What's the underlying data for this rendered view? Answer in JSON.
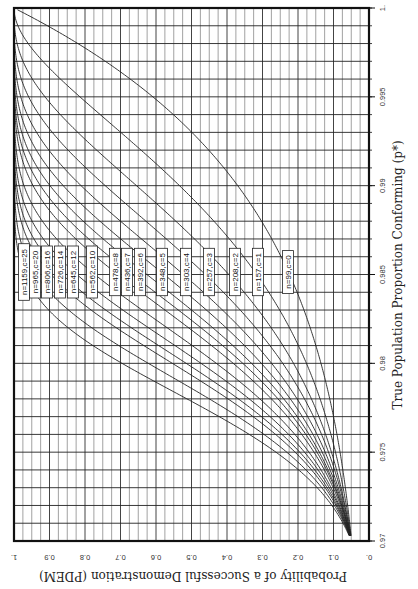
{
  "chart_data": {
    "type": "line",
    "orientation": "rotated-90-clockwise",
    "title": "",
    "xlabel": "True Population Proportion Conforming (p*)",
    "ylabel": "Probability of a Successful Demonstration (PDEM)",
    "xlim": [
      0.97,
      1.0
    ],
    "ylim": [
      0.0,
      1.0
    ],
    "x_ticks": [
      "0.97",
      "0.975",
      "0.98",
      "0.985",
      "0.99",
      "0.995",
      "1."
    ],
    "y_ticks": [
      "0.",
      "0.1",
      "0.2",
      "0.3",
      "0.4",
      "0.5",
      "0.6",
      "0.7",
      "0.8",
      "0.9",
      "1."
    ],
    "grid": {
      "x_minor_step": 0.001,
      "y_minor_step": 0.025,
      "major_y_step": 0.1
    },
    "curve_model": "PDEM = P(X <= c), X ~ Binomial(n, 1 - p*)",
    "series": [
      {
        "name": "n=1159,c=25",
        "n": 1159,
        "c": 25
      },
      {
        "name": "n=965,c=20",
        "n": 965,
        "c": 20
      },
      {
        "name": "n=806,c=16",
        "n": 806,
        "c": 16
      },
      {
        "name": "n=726,c=14",
        "n": 726,
        "c": 14
      },
      {
        "name": "n=645,c=12",
        "n": 645,
        "c": 12
      },
      {
        "name": "n=562,c=10",
        "n": 562,
        "c": 10
      },
      {
        "name": "n=478,c=8",
        "n": 478,
        "c": 8
      },
      {
        "name": "n=436,c=7",
        "n": 436,
        "c": 7
      },
      {
        "name": "n=392,c=6",
        "n": 392,
        "c": 6
      },
      {
        "name": "n=348,c=5",
        "n": 348,
        "c": 5
      },
      {
        "name": "n=303,c=4",
        "n": 303,
        "c": 4
      },
      {
        "name": "n=257,c=3",
        "n": 257,
        "c": 3
      },
      {
        "name": "n=208,c=2",
        "n": 208,
        "c": 2
      },
      {
        "name": "n=157,c=1",
        "n": 157,
        "c": 1
      },
      {
        "name": "n=99,c=0",
        "n": 99,
        "c": 0
      }
    ],
    "legend_positions_px": [
      24,
      35,
      47,
      60,
      73,
      92,
      115,
      127,
      140,
      162,
      186,
      209,
      235,
      258,
      288
    ]
  }
}
